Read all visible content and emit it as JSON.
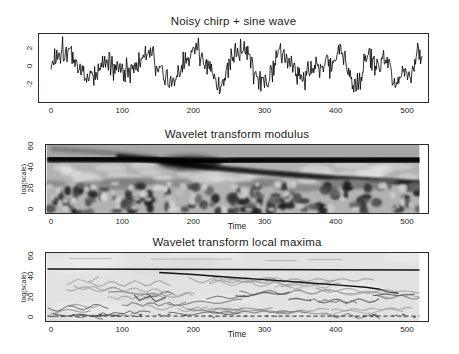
{
  "figure": {
    "background": "#ffffff",
    "frame_color": "#2b2b2b",
    "text_color": "#1c1c1c"
  },
  "chart_data": [
    {
      "id": "signal",
      "type": "line",
      "title": "Noisy chirp + sine wave",
      "xlabel": "",
      "ylabel": "",
      "xticks": [
        0,
        100,
        200,
        300,
        400,
        500
      ],
      "yticks": [
        2,
        0,
        -2
      ],
      "xlim": [
        -18.3,
        531
      ],
      "ylim": [
        -4.1,
        3.67
      ],
      "grid": false,
      "legend": null,
      "n_points": 512,
      "line_color": "#000000",
      "synthesis": {
        "description": "sum of a sine wave, a linear chirp and gaussian-like noise, amplitude roughly -3.5..3.2 over t=0..511",
        "seed": 1337,
        "sine_amp": 1.1,
        "sine_period": 62,
        "chirp_amp": 0.95,
        "chirp_period_start": 105,
        "chirp_period_end": 17,
        "noise_amp": 1.35
      }
    },
    {
      "id": "modulus",
      "type": "heatmap",
      "title": "Wavelet transform modulus",
      "xlabel": "Time",
      "ylabel": "log(scale)",
      "xticks": [
        0,
        100,
        200,
        300,
        400,
        500
      ],
      "yticks": [
        0,
        20,
        40,
        60
      ],
      "xlim": [
        -8.5,
        531
      ],
      "ylim": [
        -4.5,
        62
      ],
      "grid": false,
      "legend": null,
      "palette": {
        "base": "#b2b2b2",
        "top_strip": "#a6a6a6",
        "light_blob": "#d6d6d6",
        "lighter_blob": "#e6e6e6",
        "dark_blob_levels": [
          "#141414",
          "#2e2e2e",
          "#474747",
          "#606060"
        ],
        "band_dark": "#0d0d0d",
        "chirp_dark": "#161616",
        "precursor": "#6e6e6e",
        "mid_streak": "#7a7a7a"
      },
      "seed": 20,
      "sine_band": {
        "scale": 47,
        "note": "dark horizontal band across all times"
      },
      "sine_band_points": [
        [
          -5,
          47.6
        ],
        [
          140,
          47.4
        ],
        [
          200,
          45.6
        ],
        [
          260,
          46.6
        ],
        [
          520,
          46.9
        ]
      ],
      "chirp_band_points": [
        [
          95,
          50
        ],
        [
          150,
          46.5
        ],
        [
          220,
          40
        ],
        [
          300,
          35
        ],
        [
          400,
          29.5
        ],
        [
          516,
          25
        ]
      ],
      "precursor_points": [
        [
          0,
          57.5
        ],
        [
          60,
          55
        ],
        [
          120,
          51
        ],
        [
          150,
          48.5
        ]
      ],
      "merge_blob": {
        "x": 195,
        "scale": 44
      },
      "noise_region_top_scale": 23,
      "n_dark_blobs": 120,
      "n_light_blobs": 70,
      "n_mid_clouds": 26,
      "n_mid_streaks": 16
    },
    {
      "id": "maxima",
      "type": "ridge-lines",
      "title": "Wavelet transform local maxima",
      "xlabel": "Time",
      "ylabel": "log(scale)",
      "xticks": [
        0,
        100,
        200,
        300,
        400,
        500
      ],
      "yticks": [
        0,
        20,
        40,
        60
      ],
      "xlim": [
        -8.5,
        531
      ],
      "ylim": [
        -5,
        64
      ],
      "grid": false,
      "legend": null,
      "palette": {
        "bg": "#e2e2e2",
        "patch_light": "#ececec",
        "patch_dark": "#d6d6d6",
        "ridge": "#141414",
        "hook": "#2e2e2e",
        "tail": "#606060",
        "minor_light": "#a2a2a2",
        "minor_mid": "#7c7c7c",
        "minor_dark": "#4e4e4e",
        "dots": "#3c3c3c",
        "top_faint": "#b2b2b2"
      },
      "seed": 77,
      "sine_ridge": {
        "scale_start": 47.2,
        "scale_end": 46.2,
        "x0": -5,
        "x1": 520
      },
      "chirp_ridge_points": [
        [
          152,
          43.8
        ],
        [
          200,
          41.8
        ],
        [
          250,
          39.2
        ],
        [
          300,
          36.8
        ],
        [
          350,
          34.2
        ],
        [
          400,
          31.6
        ],
        [
          442,
          29.3
        ],
        [
          462,
          27.2
        ]
      ],
      "chirp_hook_points": [
        [
          462,
          27.2
        ],
        [
          474,
          24.6
        ],
        [
          488,
          23.2
        ]
      ],
      "right_tail_points": [
        [
          452,
          21
        ],
        [
          470,
          22.5
        ],
        [
          488,
          21
        ],
        [
          511,
          22.5
        ]
      ],
      "top_dash_segments": [
        [
          25,
          57.5,
          85
        ],
        [
          140,
          57,
          255
        ],
        [
          300,
          55.5,
          345
        ],
        [
          360,
          56.5,
          410
        ]
      ],
      "n_minor_ridges": 50,
      "bottom_dash_scale": 0.8,
      "n_bottom_dots": 34
    }
  ]
}
